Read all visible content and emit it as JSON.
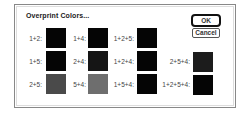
{
  "dialog": {
    "title": "Overprint Colors...",
    "buttons": {
      "ok": "OK",
      "cancel": "Cancel"
    },
    "swatches": [
      {
        "label": "1+2:",
        "color": "#050505"
      },
      {
        "label": "1+5:",
        "color": "#050505"
      },
      {
        "label": "2+5:",
        "color": "#4a4a4a"
      },
      {
        "label": "1+4:",
        "color": "#050505"
      },
      {
        "label": "2+4:",
        "color": "#151515"
      },
      {
        "label": "5+4:",
        "color": "#6e6e6e"
      },
      {
        "label": "1+2+5:",
        "color": "#050505"
      },
      {
        "label": "1+2+4:",
        "color": "#050505"
      },
      {
        "label": "1+5+4:",
        "color": "#050505"
      },
      {
        "label": "2+5+4:",
        "color": "#1c1c1c"
      },
      {
        "label": "1+2+5+4:",
        "color": "#050505"
      }
    ]
  }
}
